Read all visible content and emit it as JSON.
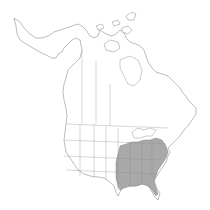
{
  "map": {
    "type": "species range distribution map",
    "region": "North America",
    "background_color": "#ffffff",
    "outline_color": "#6a6a6a",
    "range_fill_color": "#a9a9a9",
    "range": {
      "label": "Native range",
      "states": [
        "Missouri",
        "Arkansas",
        "Louisiana",
        "Oklahoma (east)",
        "Texas (east)",
        "Illinois (south)",
        "Indiana (south)",
        "Ohio (south)",
        "Kentucky",
        "Tennessee",
        "Mississippi",
        "Alabama",
        "Georgia",
        "Florida",
        "South Carolina",
        "North Carolina",
        "Virginia",
        "West Virginia",
        "Maryland",
        "Delaware"
      ]
    }
  }
}
